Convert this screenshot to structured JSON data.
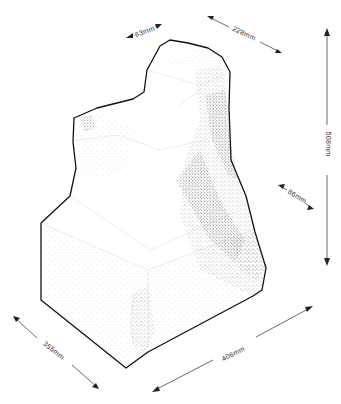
{
  "figure": {
    "line_color": "#111111",
    "stipple_color": "#555555",
    "background": "#ffffff"
  },
  "dimensions": [
    {
      "id": "top-depth",
      "label": "63mm"
    },
    {
      "id": "top-width",
      "label": "228mm"
    },
    {
      "id": "height",
      "label": "508mm"
    },
    {
      "id": "ledge",
      "label": "86mm"
    },
    {
      "id": "base-depth",
      "label": "355mm"
    },
    {
      "id": "base-width",
      "label": "406mm"
    }
  ]
}
